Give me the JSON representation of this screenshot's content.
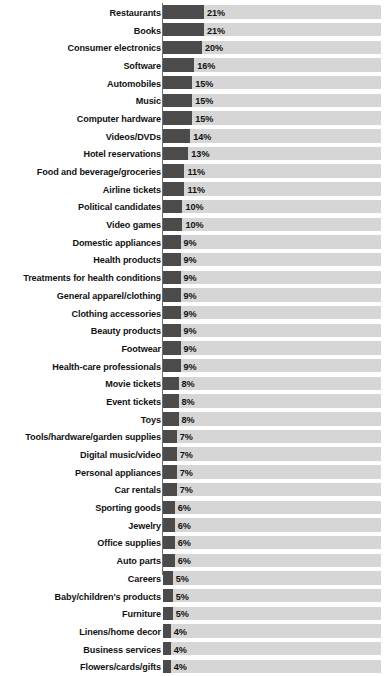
{
  "chart_data": {
    "type": "bar",
    "title": "",
    "subtitle": "",
    "xlabel": "",
    "ylabel": "",
    "orientation": "horizontal",
    "grid": false,
    "legend": "none",
    "value_suffix": "%",
    "xlim": [
      0,
      112
    ],
    "track_max": 112,
    "colors": {
      "bar": "#4b4b4b",
      "track": "#d6d6d6",
      "axis": "#6e6e6e",
      "text": "#111111",
      "background": "#ffffff"
    },
    "categories": [
      "Restaurants",
      "Books",
      "Consumer electronics",
      "Software",
      "Automobiles",
      "Music",
      "Computer hardware",
      "Videos/DVDs",
      "Hotel reservations",
      "Food and beverage/groceries",
      "Airline tickets",
      "Political candidates",
      "Video games",
      "Domestic appliances",
      "Health products",
      "Treatments for health conditions",
      "General apparel/clothing",
      "Clothing accessories",
      "Beauty products",
      "Footwear",
      "Health-care professionals",
      "Movie tickets",
      "Event tickets",
      "Toys",
      "Tools/hardware/garden supplies",
      "Digital music/video",
      "Personal appliances",
      "Car rentals",
      "Sporting goods",
      "Jewelry",
      "Office supplies",
      "Auto parts",
      "Careers",
      "Baby/children's products",
      "Furniture",
      "Linens/home decor",
      "Business services",
      "Flowers/cards/gifts"
    ],
    "values": [
      21,
      21,
      20,
      16,
      15,
      15,
      15,
      14,
      13,
      11,
      11,
      10,
      10,
      9,
      9,
      9,
      9,
      9,
      9,
      9,
      9,
      8,
      8,
      8,
      7,
      7,
      7,
      7,
      6,
      6,
      6,
      6,
      5,
      5,
      5,
      4,
      4,
      4
    ],
    "value_labels": [
      "21%",
      "21%",
      "20%",
      "16%",
      "15%",
      "15%",
      "15%",
      "14%",
      "13%",
      "11%",
      "11%",
      "10%",
      "10%",
      "9%",
      "9%",
      "9%",
      "9%",
      "9%",
      "9%",
      "9%",
      "9%",
      "8%",
      "8%",
      "8%",
      "7%",
      "7%",
      "7%",
      "7%",
      "6%",
      "6%",
      "6%",
      "6%",
      "5%",
      "5%",
      "5%",
      "4%",
      "4%",
      "4%"
    ]
  }
}
